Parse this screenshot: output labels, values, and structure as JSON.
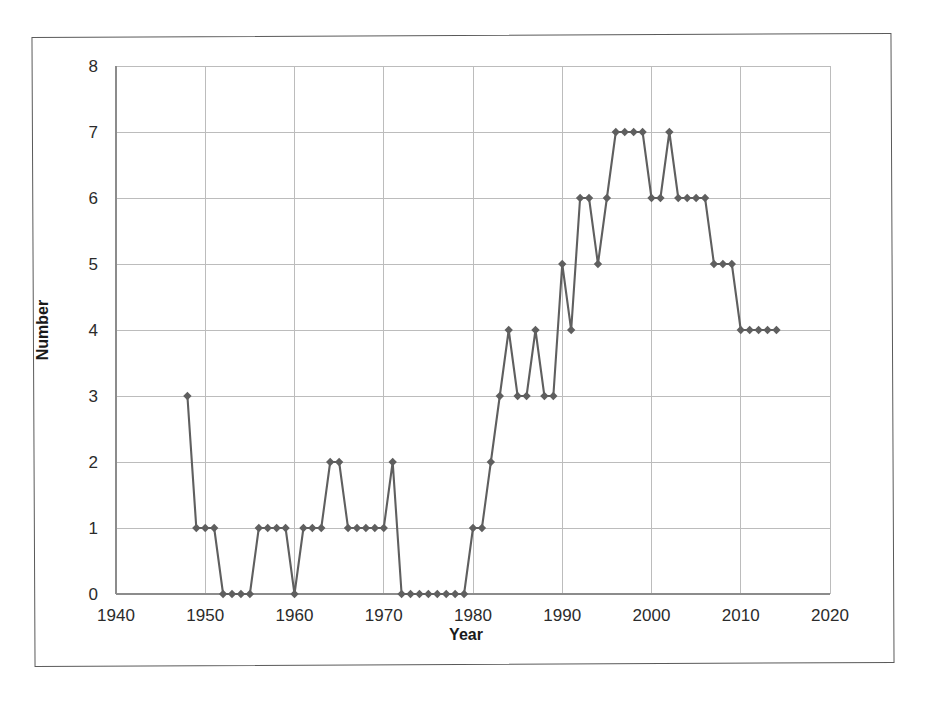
{
  "chart_data": {
    "type": "line",
    "title": "",
    "xlabel": "Year",
    "ylabel": "Number",
    "xlim": [
      1940,
      2020
    ],
    "ylim": [
      0,
      8
    ],
    "xticks": [
      1940,
      1950,
      1960,
      1970,
      1980,
      1990,
      2000,
      2010,
      2020
    ],
    "xtick_labels": [
      "1940",
      "1950",
      "1960",
      "1970",
      "1980",
      "1990",
      "2000",
      "2010",
      "2020"
    ],
    "yticks": [
      0,
      1,
      2,
      3,
      4,
      5,
      6,
      7,
      8
    ],
    "ytick_labels": [
      "0",
      "1",
      "2",
      "3",
      "4",
      "5",
      "6",
      "7",
      "8"
    ],
    "grid": true,
    "legend": false,
    "marker": "diamond",
    "series_color": "#5f5f5f",
    "x": [
      1948,
      1949,
      1950,
      1951,
      1952,
      1953,
      1954,
      1955,
      1956,
      1957,
      1958,
      1959,
      1960,
      1961,
      1962,
      1963,
      1964,
      1965,
      1966,
      1967,
      1968,
      1969,
      1970,
      1971,
      1972,
      1973,
      1974,
      1975,
      1976,
      1977,
      1978,
      1979,
      1980,
      1981,
      1982,
      1983,
      1984,
      1985,
      1986,
      1987,
      1988,
      1989,
      1990,
      1991,
      1992,
      1993,
      1994,
      1995,
      1996,
      1997,
      1998,
      1999,
      2000,
      2001,
      2002,
      2003,
      2004,
      2005,
      2006,
      2007,
      2008,
      2009,
      2010,
      2011,
      2012,
      2013,
      2014
    ],
    "values": [
      3,
      1,
      1,
      1,
      0,
      0,
      0,
      0,
      1,
      1,
      1,
      1,
      0,
      1,
      1,
      1,
      2,
      2,
      1,
      1,
      1,
      1,
      1,
      2,
      0,
      0,
      0,
      0,
      0,
      0,
      0,
      0,
      1,
      1,
      2,
      3,
      4,
      3,
      3,
      4,
      3,
      3,
      5,
      4,
      6,
      6,
      5,
      6,
      7,
      7,
      7,
      7,
      6,
      6,
      7,
      6,
      6,
      6,
      6,
      5,
      5,
      5,
      4,
      4,
      4,
      4,
      4
    ],
    "series": [
      {
        "name": "Number",
        "values": [
          3,
          1,
          1,
          1,
          0,
          0,
          0,
          0,
          1,
          1,
          1,
          1,
          0,
          1,
          1,
          1,
          2,
          2,
          1,
          1,
          1,
          1,
          1,
          2,
          0,
          0,
          0,
          0,
          0,
          0,
          0,
          0,
          1,
          1,
          2,
          3,
          4,
          3,
          3,
          4,
          3,
          3,
          5,
          4,
          6,
          6,
          5,
          6,
          7,
          7,
          7,
          7,
          6,
          6,
          7,
          6,
          6,
          6,
          6,
          5,
          5,
          5,
          4,
          4,
          4,
          4,
          4
        ]
      }
    ]
  },
  "axes": {
    "x_title": "Year",
    "y_title": "Number"
  },
  "colors": {
    "line": "#5f5f5f",
    "marker": "#5f5f5f",
    "grid": "#bcbcbc",
    "axis": "#8c8c8c",
    "frame": "#5a5a5a",
    "text": "#2b2b2b",
    "background": "#ffffff"
  }
}
